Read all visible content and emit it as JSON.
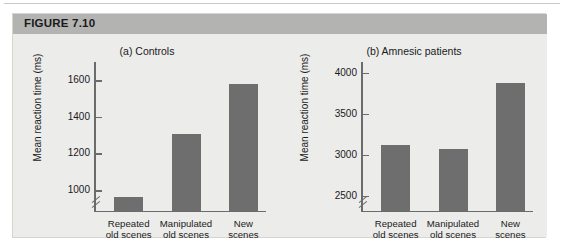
{
  "figure": {
    "header_label": "FIGURE 7.10"
  },
  "chart_data": [
    {
      "type": "bar",
      "panel": "a",
      "title": "(a) Controls",
      "xlabel": "",
      "ylabel": "Mean reaction time (ms)",
      "categories": [
        "Repeated old scenes",
        "Manipulated old scenes",
        "New scenes"
      ],
      "category_lines": [
        [
          "Repeated",
          "old scenes"
        ],
        [
          "Manipulated",
          "old scenes"
        ],
        [
          "New",
          "scenes"
        ]
      ],
      "values": [
        960,
        1305,
        1580
      ],
      "ticks": [
        1000,
        1200,
        1400,
        1600
      ],
      "tick_labels": [
        "1000",
        "1200",
        "1400",
        "1600"
      ],
      "ylim": [
        880,
        1700
      ],
      "axis_break": true,
      "grid": false,
      "legend": "none",
      "bar_color": "#6e6e6e"
    },
    {
      "type": "bar",
      "panel": "b",
      "title": "(b) Amnesic patients",
      "xlabel": "",
      "ylabel": "Mean reaction time (ms)",
      "categories": [
        "Repeated old scenes",
        "Manipulated old scenes",
        "New scenes"
      ],
      "category_lines": [
        [
          "Repeated",
          "old scenes"
        ],
        [
          "Manipulated",
          "old scenes"
        ],
        [
          "New",
          "scenes"
        ]
      ],
      "values": [
        3120,
        3070,
        3880
      ],
      "ticks": [
        2500,
        3000,
        3500,
        4000
      ],
      "tick_labels": [
        "2500",
        "3000",
        "3500",
        "4000"
      ],
      "ylim": [
        2300,
        4130
      ],
      "axis_break": true,
      "grid": false,
      "legend": "none",
      "bar_color": "#6e6e6e"
    }
  ]
}
